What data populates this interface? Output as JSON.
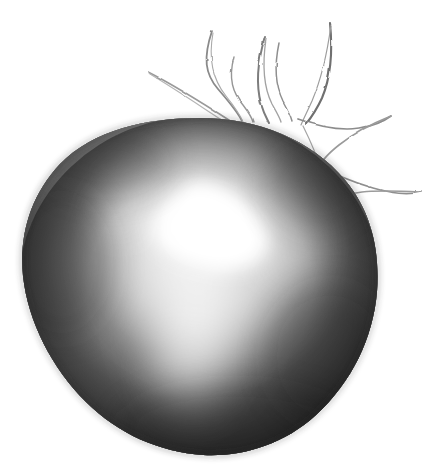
{
  "artwork": {
    "title": "Graphite drawing of a round fruit",
    "subject": "tomato",
    "medium": "pencil on white paper",
    "style": "monochrome hand-drawn sketch",
    "canvas": {
      "width": 438,
      "height": 473,
      "background_color": "#ffffff"
    },
    "palette": {
      "paper": "#ffffff",
      "body_darkest": "#2f2f2f",
      "body_dark": "#3c3c3c",
      "body_mid": "#6a6a6a",
      "body_light": "#b4b4b4",
      "highlight_core": "#ffffff",
      "highlight_soft": "#e9e9e9",
      "line_stroke": "#777777",
      "line_stroke_dark": "#5a5a5a"
    },
    "body": {
      "label": "fruit body",
      "shape": "irregular circle",
      "center_x": 200,
      "center_y": 288,
      "radius_x": 178,
      "radius_y": 168,
      "bounds": {
        "left": 22,
        "top": 118,
        "right": 378,
        "bottom": 455
      }
    },
    "highlight": {
      "label": "specular highlight",
      "core_x": 205,
      "core_y": 228,
      "core_radius_x": 52,
      "core_radius_y": 44,
      "glow_radius_x": 128,
      "glow_radius_y": 148,
      "streak_x": 196,
      "streak_y": 330,
      "streak_radius_x": 68,
      "streak_radius_y": 92
    },
    "calyx": {
      "label": "calyx sepals",
      "count": 7,
      "origin_x": 250,
      "origin_y": 118,
      "sepals": [
        {
          "name": "sepal-far-left",
          "path": "M 148 72 C 176 86 204 104 232 122"
        },
        {
          "name": "sepal-left",
          "path": "M 212 31 C 204 56 206 72 219 88 C 230 101 238 110 243 121"
        },
        {
          "name": "sepal-left-mid",
          "path": "M 234 57 C 229 78 234 92 244 104 C 250 112 253 117 254 122"
        },
        {
          "name": "sepal-center",
          "path": "M 265 37 C 258 62 257 84 262 103 C 265 113 268 118 270 122"
        },
        {
          "name": "sepal-center-r",
          "path": "M 279 43 C 274 66 275 86 282 100 C 287 110 290 116 292 120"
        },
        {
          "name": "sepal-right",
          "path": "M 330 23 C 332 52 330 78 322 97 C 316 110 310 118 306 123"
        },
        {
          "name": "sepal-right-v1",
          "path": "M 298 119 C 320 126 340 130 360 127 C 372 125 382 121 390 116"
        },
        {
          "name": "sepal-right-v2",
          "path": "M 390 116 C 370 124 352 134 338 145 C 328 153 322 160 320 166"
        },
        {
          "name": "sepal-right-v3",
          "path": "M 320 166 C 334 174 352 181 372 187 C 392 193 408 194 420 192"
        },
        {
          "name": "sepal-right-v4",
          "path": "M 420 192 C 400 191 380 189 362 191 C 346 193 334 197 326 202"
        }
      ]
    }
  }
}
